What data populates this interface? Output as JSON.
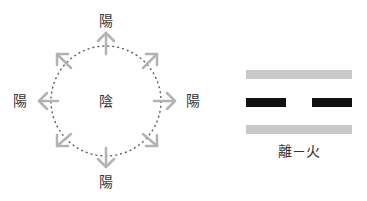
{
  "diagram": {
    "left_figure": {
      "center_label": "陰",
      "outer_labels": {
        "top": "陽",
        "left": "陽",
        "right": "陽",
        "bottom": "陽"
      },
      "circle_style": "dotted",
      "arrow_count": 8,
      "arrow_color": "#b3b3b3",
      "circle_color": "#555555"
    },
    "trigram": {
      "lines": [
        {
          "type": "solid",
          "color": "#c8c8c8"
        },
        {
          "type": "broken",
          "color": "#111111"
        },
        {
          "type": "solid",
          "color": "#c8c8c8"
        }
      ],
      "caption": "離－火"
    }
  }
}
